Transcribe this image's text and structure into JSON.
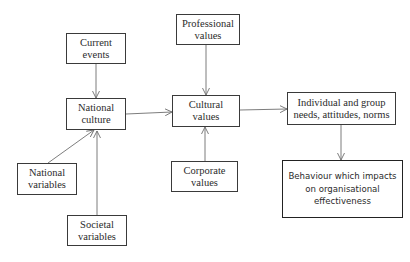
{
  "diagram": {
    "nodes": {
      "current_events": {
        "line1": "Current",
        "line2": "events"
      },
      "national_culture": {
        "line1": "National",
        "line2": "culture"
      },
      "national_variables": {
        "line1": "National",
        "line2": "variables"
      },
      "societal_variables": {
        "line1": "Societal",
        "line2": "variables"
      },
      "professional_values": {
        "line1": "Professional",
        "line2": "values"
      },
      "cultural_values": {
        "line1": "Cultural",
        "line2": "values"
      },
      "corporate_values": {
        "line1": "Corporate",
        "line2": "values"
      },
      "individual_group": {
        "line1": "Individual and group",
        "line2": "needs, attitudes, norms"
      },
      "behaviour": {
        "line1": "Behaviour which impacts",
        "line2": "on organisational",
        "line3": "effectiveness"
      }
    },
    "edges": [
      {
        "from": "Current events",
        "to": "National culture"
      },
      {
        "from": "National variables",
        "to": "National culture"
      },
      {
        "from": "Societal variables",
        "to": "National culture"
      },
      {
        "from": "National culture",
        "to": "Cultural values"
      },
      {
        "from": "Professional values",
        "to": "Cultural values"
      },
      {
        "from": "Corporate values",
        "to": "Cultural values"
      },
      {
        "from": "Cultural values",
        "to": "Individual and group needs, attitudes, norms"
      },
      {
        "from": "Individual and group needs, attitudes, norms",
        "to": "Behaviour which impacts on organisational effectiveness"
      }
    ],
    "colors": {
      "line": "#6e6e6e",
      "border": "#3a3a3a",
      "text": "#2b2b2b"
    }
  }
}
